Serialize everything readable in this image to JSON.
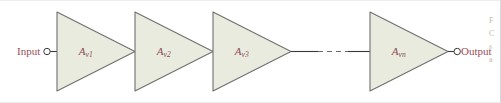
{
  "figure": {
    "name": "cascaded-amplifier-stages-diagram",
    "input_label": "Input",
    "output_label": "Output",
    "fill_color": "#e9ebdf",
    "stroke_color": "#6f6f6f",
    "label_color": "#8a4a52",
    "io_label_color": "#9c4a58",
    "wire_color": "#4a4a4a"
  },
  "stages": [
    {
      "id": "stage-1",
      "base": "A",
      "sub": "v1",
      "x": 57,
      "width": 78
    },
    {
      "id": "stage-2",
      "base": "A",
      "sub": "v2",
      "x": 135,
      "width": 78
    },
    {
      "id": "stage-3",
      "base": "A",
      "sub": "v3",
      "x": 213,
      "width": 78
    },
    {
      "id": "stage-n",
      "base": "A",
      "sub": "vn",
      "x": 370,
      "width": 78
    }
  ],
  "caption_sliver": {
    "lines": [
      "F",
      "C",
      "s",
      "a"
    ]
  }
}
